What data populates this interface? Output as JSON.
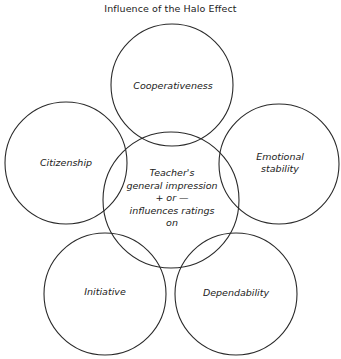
{
  "title": "Influence of the Halo Effect",
  "center": {
    "line1": "Teacher's",
    "line2": "general impression",
    "line3": "+ or —",
    "line4": "influences ratings",
    "line5": "on"
  },
  "traits": {
    "top": "Cooperativeness",
    "left": "Citizenship",
    "right_line1": "Emotional",
    "right_line2": "stability",
    "bottom_left": "Initiative",
    "bottom_right": "Dependability"
  },
  "style": {
    "stroke": "#2a2a2a",
    "background": "#ffffff"
  }
}
